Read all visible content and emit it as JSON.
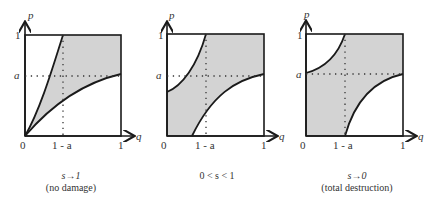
{
  "panels": [
    {
      "caption_line1": "s→1",
      "caption_line2": "(no damage)",
      "axis_y": "p",
      "axis_x": "q",
      "tick_y_top": "1",
      "tick_y_mid": "a",
      "tick_origin": "0",
      "tick_x_mid": "1 - a",
      "tick_x_right": "1"
    },
    {
      "caption_line1": "0 < s < 1",
      "caption_line2": "",
      "axis_y": "p",
      "axis_x": "q",
      "tick_y_top": "1",
      "tick_y_mid": "a",
      "tick_origin": "0",
      "tick_x_mid": "1 - a",
      "tick_x_right": "1"
    },
    {
      "caption_line1": "s→0",
      "caption_line2": "(total destruction)",
      "axis_y": "p",
      "axis_x": "q",
      "tick_y_top": "1",
      "tick_y_mid": "a",
      "tick_origin": "0",
      "tick_x_mid": "1 - a",
      "tick_x_right": "1"
    }
  ],
  "colors": {
    "shade": "#d3d3d3",
    "line": "#1a1a1a"
  }
}
